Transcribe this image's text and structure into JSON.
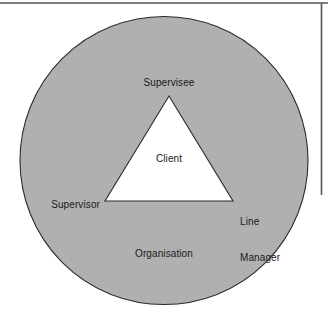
{
  "figure": {
    "type": "concentric-triangle-in-circle-diagram",
    "width": 328,
    "height": 321,
    "background_color": "#ffffff",
    "frame": {
      "top_rule_color": "#555555",
      "right_rule_color": "#555555"
    },
    "circle": {
      "name": "organisation-circle",
      "fill_color": "#b0b0b0",
      "stroke_color": "#2b2b2b",
      "center_x": 164,
      "center_y": 160,
      "radius": 144
    },
    "triangle": {
      "name": "client-triangle",
      "fill_color": "#ffffff",
      "stroke_color": "#2b2b2b",
      "apex": [
        169,
        96
      ],
      "bottom_left": [
        105,
        201
      ],
      "bottom_right": [
        233,
        201
      ]
    },
    "labels": {
      "supervisee": "Supervisee",
      "client": "Client",
      "supervisor": "Supervisor",
      "line_manager_line1": "Line",
      "line_manager_line2": "Manager",
      "organisation": "Organisation"
    }
  }
}
